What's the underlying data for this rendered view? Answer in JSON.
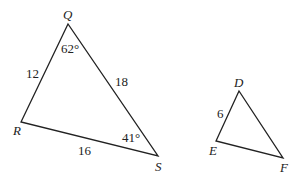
{
  "triangles": [
    {
      "name": "QRS",
      "vertices": {
        "Q": "Q",
        "R": "R",
        "S": "S"
      },
      "sides": {
        "QR": "12",
        "QS": "18",
        "RS": "16"
      },
      "angles": {
        "Q": "62°",
        "S": "41°"
      }
    },
    {
      "name": "DEF",
      "vertices": {
        "D": "D",
        "E": "E",
        "F": "F"
      },
      "sides": {
        "DE": "6"
      }
    }
  ],
  "colors": {
    "line": "#222222"
  }
}
